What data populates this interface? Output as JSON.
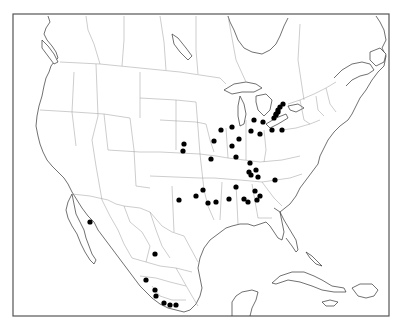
{
  "map": {
    "title": "",
    "region": "North America",
    "marker_color": "#000000",
    "outline_color": "#333333",
    "border_color": "#9a9a9a",
    "background": "#ffffff",
    "localities": [
      {
        "id": "mi-1",
        "lon": -82.6,
        "lat": 43.0
      },
      {
        "id": "mi-2",
        "lon": -82.9,
        "lat": 42.6
      },
      {
        "id": "mi-3",
        "lon": -83.3,
        "lat": 42.3
      },
      {
        "id": "mi-4",
        "lon": -83.6,
        "lat": 42.0
      },
      {
        "id": "on-1",
        "lon": -81.2,
        "lat": 43.0
      },
      {
        "id": "on-2",
        "lon": -81.5,
        "lat": 42.7
      },
      {
        "id": "on-3",
        "lon": -81.9,
        "lat": 42.4
      },
      {
        "id": "mi-5",
        "lon": -85.6,
        "lat": 42.3
      },
      {
        "id": "oh-1",
        "lon": -83.8,
        "lat": 41.6
      },
      {
        "id": "oh-2",
        "lon": -82.6,
        "lat": 41.4
      },
      {
        "id": "oh-3",
        "lon": -81.6,
        "lat": 41.4
      },
      {
        "id": "in-1",
        "lon": -86.3,
        "lat": 41.6
      },
      {
        "id": "in-2",
        "lon": -85.3,
        "lat": 40.5
      },
      {
        "id": "in-3",
        "lon": -86.2,
        "lat": 39.7
      },
      {
        "id": "in-4",
        "lon": -85.7,
        "lat": 38.9
      },
      {
        "id": "oh-4",
        "lon": -84.2,
        "lat": 40.0
      },
      {
        "id": "oh-5",
        "lon": -83.6,
        "lat": 39.6
      },
      {
        "id": "il-1",
        "lon": -88.0,
        "lat": 41.8
      },
      {
        "id": "il-2",
        "lon": -89.0,
        "lat": 40.4
      },
      {
        "id": "il-3",
        "lon": -89.6,
        "lat": 38.6
      },
      {
        "id": "ky-1",
        "lon": -86.4,
        "lat": 38.1
      },
      {
        "id": "ky-2",
        "lon": -85.6,
        "lat": 38.2
      },
      {
        "id": "mo-1",
        "lon": -94.6,
        "lat": 39.1
      },
      {
        "id": "mo-2",
        "lon": -94.2,
        "lat": 38.4
      },
      {
        "id": "tn-1",
        "lon": -86.9,
        "lat": 36.2
      },
      {
        "id": "tn-2",
        "lon": -86.7,
        "lat": 36.0
      },
      {
        "id": "tn-3",
        "lon": -85.2,
        "lat": 35.2
      },
      {
        "id": "sc-1",
        "lon": -81.6,
        "lat": 35.0
      },
      {
        "id": "ms-1",
        "lon": -88.7,
        "lat": 34.2
      },
      {
        "id": "ms-2",
        "lon": -89.8,
        "lat": 32.5
      },
      {
        "id": "al-1",
        "lon": -86.9,
        "lat": 33.0
      },
      {
        "id": "al-2",
        "lon": -86.3,
        "lat": 33.8
      },
      {
        "id": "al-3",
        "lon": -86.2,
        "lat": 32.4
      },
      {
        "id": "ga-1",
        "lon": -84.8,
        "lat": 32.9
      },
      {
        "id": "la-1",
        "lon": -93.7,
        "lat": 32.5
      },
      {
        "id": "tx-1",
        "lon": -97.0,
        "lat": 32.7
      },
      {
        "id": "tx-2",
        "lon": -97.6,
        "lat": 30.4
      },
      {
        "id": "tx-3",
        "lon": -99.2,
        "lat": 35.6
      },
      {
        "id": "chih-1",
        "lon": -107.5,
        "lat": 28.4
      },
      {
        "id": "mx-1",
        "lon": -100.3,
        "lat": 25.7
      },
      {
        "id": "mx-2",
        "lon": -101.2,
        "lat": 22.3
      },
      {
        "id": "mx-3",
        "lon": -100.5,
        "lat": 21.0
      },
      {
        "id": "mx-4",
        "lon": -100.3,
        "lat": 20.6
      },
      {
        "id": "mx-5",
        "lon": -99.4,
        "lat": 19.5
      },
      {
        "id": "mx-6",
        "lon": -98.9,
        "lat": 19.1
      },
      {
        "id": "mx-7",
        "lon": -97.9,
        "lat": 19.0
      }
    ],
    "dots_px": [
      [
        283,
        104
      ],
      [
        280,
        107
      ],
      [
        278,
        110
      ],
      [
        276,
        114
      ],
      [
        278,
        112
      ],
      [
        276,
        115
      ],
      [
        274,
        118
      ],
      [
        254,
        120
      ],
      [
        263,
        122
      ],
      [
        272,
        130
      ],
      [
        282,
        130
      ],
      [
        232,
        127
      ],
      [
        239,
        139
      ],
      [
        232,
        146
      ],
      [
        236,
        157
      ],
      [
        251,
        131
      ],
      [
        260,
        134
      ],
      [
        221,
        130
      ],
      [
        214,
        141
      ],
      [
        211,
        159
      ],
      [
        250,
        163
      ],
      [
        256,
        170
      ],
      [
        203,
        190
      ],
      [
        196,
        196
      ],
      [
        249,
        172
      ],
      [
        251,
        175
      ],
      [
        258,
        177
      ],
      [
        275,
        180
      ],
      [
        236,
        187
      ],
      [
        229,
        199
      ],
      [
        244,
        199
      ],
      [
        255,
        191
      ],
      [
        257,
        200
      ],
      [
        260,
        196
      ],
      [
        248,
        202
      ],
      [
        216,
        202
      ],
      [
        208,
        203
      ],
      [
        179,
        200
      ],
      [
        183,
        151
      ],
      [
        184,
        144
      ],
      [
        90,
        222
      ],
      [
        155,
        254
      ],
      [
        146,
        280
      ],
      [
        155,
        290
      ],
      [
        156,
        296
      ],
      [
        164,
        303
      ],
      [
        170,
        305
      ],
      [
        176,
        305
      ]
    ]
  }
}
